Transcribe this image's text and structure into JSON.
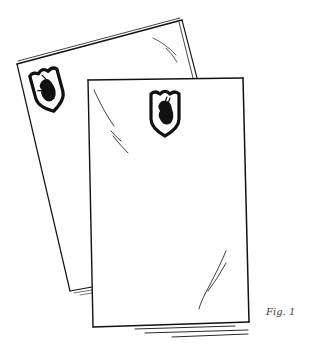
{
  "figure": {
    "caption": "Fig. 1",
    "colors": {
      "ink": "#111111",
      "paper": "#ffffff",
      "caption": "#444444"
    },
    "sheets": [
      {
        "name": "back-sheet",
        "emblem": "shield-with-profile-head"
      },
      {
        "name": "front-sheet",
        "emblem": "shield-with-profile-head"
      }
    ]
  }
}
